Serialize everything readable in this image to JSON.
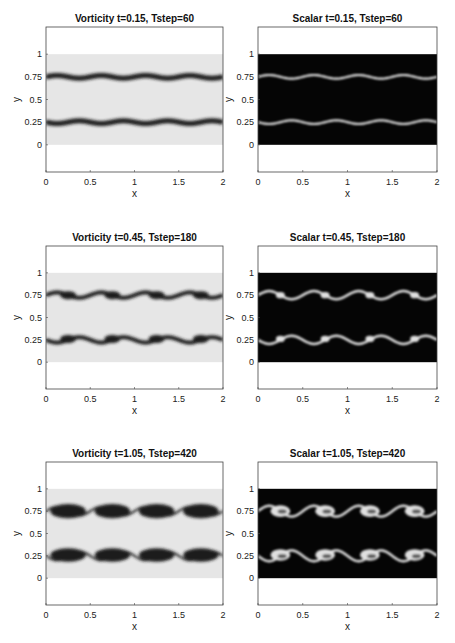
{
  "chart_data": [
    {
      "type": "heatmap",
      "field": "vorticity",
      "title": "Vorticity  t=0.15, Tstep=60",
      "t": 0.15,
      "tstep": 60,
      "xlabel": "x",
      "ylabel": "y",
      "xlim": [
        0,
        2
      ],
      "ylim": [
        -0.3,
        1.3
      ],
      "xticks": [
        "0",
        "0.5",
        "1",
        "1.5",
        "2"
      ],
      "yticks": [
        "0",
        "0.25",
        "0.5",
        "0.75",
        "1"
      ],
      "colormap": "gray",
      "background": "#e6e6e6",
      "feature": "#1a1a1a",
      "layers_y": [
        0.25,
        0.75
      ],
      "waves": 4,
      "amplitude": 0.015,
      "roll_stage": 0
    },
    {
      "type": "heatmap",
      "field": "scalar",
      "title": "Scalar   t=0.15, Tstep=60",
      "t": 0.15,
      "tstep": 60,
      "xlabel": "x",
      "ylabel": "y",
      "xlim": [
        0,
        2
      ],
      "ylim": [
        -0.3,
        1.3
      ],
      "xticks": [
        "0",
        "0.5",
        "1",
        "1.5",
        "2"
      ],
      "yticks": [
        "0",
        "0.25",
        "0.5",
        "0.75",
        "1"
      ],
      "colormap": "gray",
      "background": "#050505",
      "feature": "#e0e0e0",
      "layers_y": [
        0.25,
        0.75
      ],
      "waves": 4,
      "amplitude": 0.02,
      "roll_stage": 0
    },
    {
      "type": "heatmap",
      "field": "vorticity",
      "title": "Vorticity  t=0.45, Tstep=180",
      "t": 0.45,
      "tstep": 180,
      "xlabel": "x",
      "ylabel": "y",
      "xlim": [
        0,
        2
      ],
      "ylim": [
        -0.3,
        1.3
      ],
      "xticks": [
        "0",
        "0.5",
        "1",
        "1.5",
        "2"
      ],
      "yticks": [
        "0",
        "0.25",
        "0.5",
        "0.75",
        "1"
      ],
      "colormap": "gray",
      "background": "#e6e6e6",
      "feature": "#1a1a1a",
      "layers_y": [
        0.25,
        0.75
      ],
      "waves": 4,
      "amplitude": 0.03,
      "roll_stage": 1
    },
    {
      "type": "heatmap",
      "field": "scalar",
      "title": "Scalar   t=0.45, Tstep=180",
      "t": 0.45,
      "tstep": 180,
      "xlabel": "x",
      "ylabel": "y",
      "xlim": [
        0,
        2
      ],
      "ylim": [
        -0.3,
        1.3
      ],
      "xticks": [
        "0",
        "0.5",
        "1",
        "1.5",
        "2"
      ],
      "yticks": [
        "0",
        "0.25",
        "0.5",
        "0.75",
        "1"
      ],
      "colormap": "gray",
      "background": "#050505",
      "feature": "#e0e0e0",
      "layers_y": [
        0.25,
        0.75
      ],
      "waves": 4,
      "amplitude": 0.045,
      "roll_stage": 1
    },
    {
      "type": "heatmap",
      "field": "vorticity",
      "title": "Vorticity  t=1.05, Tstep=420",
      "t": 1.05,
      "tstep": 420,
      "xlabel": "x",
      "ylabel": "y",
      "xlim": [
        0,
        2
      ],
      "ylim": [
        -0.3,
        1.3
      ],
      "xticks": [
        "0",
        "0.5",
        "1",
        "1.5",
        "2"
      ],
      "yticks": [
        "0",
        "0.25",
        "0.5",
        "0.75",
        "1"
      ],
      "colormap": "gray",
      "background": "#e6e6e6",
      "feature": "#1a1a1a",
      "layers_y": [
        0.25,
        0.75
      ],
      "waves": 4,
      "amplitude": 0.05,
      "roll_stage": 2
    },
    {
      "type": "heatmap",
      "field": "scalar",
      "title": "Scalar   t=1.05, Tstep=420",
      "t": 1.05,
      "tstep": 420,
      "xlabel": "x",
      "ylabel": "y",
      "xlim": [
        0,
        2
      ],
      "ylim": [
        -0.3,
        1.3
      ],
      "xticks": [
        "0",
        "0.5",
        "1",
        "1.5",
        "2"
      ],
      "yticks": [
        "0",
        "0.25",
        "0.5",
        "0.75",
        "1"
      ],
      "colormap": "gray",
      "background": "#050505",
      "feature": "#e0e0e0",
      "layers_y": [
        0.25,
        0.75
      ],
      "waves": 4,
      "amplitude": 0.06,
      "roll_stage": 2
    }
  ]
}
